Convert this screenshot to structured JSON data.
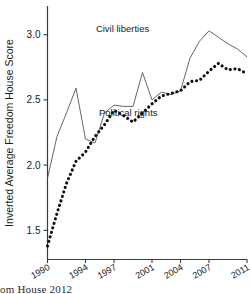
{
  "figure": {
    "source_caption": "Freedom House 2012"
  },
  "chart_data": {
    "type": "line",
    "title": "",
    "xlabel": "",
    "ylabel": "Inverted Average Freedom House Score",
    "xlim": [
      1990,
      2011
    ],
    "ylim": [
      1.28,
      3.22
    ],
    "grid": false,
    "legend": "inline-annotations",
    "x": [
      1990,
      1991,
      1992,
      1993,
      1994,
      1995,
      1996,
      1997,
      1998,
      1999,
      2000,
      2001,
      2002,
      2003,
      2004,
      2005,
      2006,
      2007,
      2008,
      2009,
      2010,
      2011
    ],
    "xticks": [
      1990,
      1994,
      1997,
      2001,
      2004,
      2007,
      2011
    ],
    "xticklabels": [
      "1990",
      "1994",
      "1997",
      "2001",
      "2004",
      "2007",
      "2011"
    ],
    "yticks": [
      1.5,
      2.0,
      2.5,
      3.0
    ],
    "yticklabels": [
      "1.5",
      "2.0",
      "2.5",
      "3.0"
    ],
    "series": [
      {
        "name": "Civil liberties",
        "style": "solid-thin",
        "color": "#555555",
        "label_x": 1997.9,
        "label_y": 3.02,
        "values": [
          1.9,
          2.22,
          2.4,
          2.59,
          2.2,
          2.17,
          2.4,
          2.46,
          2.45,
          2.45,
          2.71,
          2.5,
          2.56,
          2.54,
          2.57,
          2.82,
          2.95,
          3.03,
          2.98,
          2.93,
          2.89,
          2.83
        ]
      },
      {
        "name": "Political rights",
        "style": "dotted-thick",
        "color": "#111111",
        "label_x": 1998.5,
        "label_y": 2.38,
        "values": [
          1.38,
          1.63,
          1.86,
          2.03,
          2.1,
          2.22,
          2.31,
          2.42,
          2.38,
          2.33,
          2.4,
          2.47,
          2.53,
          2.55,
          2.57,
          2.64,
          2.65,
          2.72,
          2.78,
          2.73,
          2.74,
          2.7
        ]
      }
    ]
  }
}
